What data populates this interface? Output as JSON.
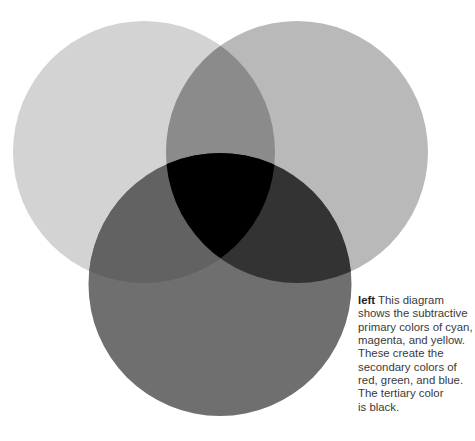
{
  "diagram": {
    "type": "venn-subtractive-color",
    "circles": [
      {
        "name": "cyan",
        "cx": 144,
        "cy": 152,
        "r": 131,
        "fill": "#d3d3d3"
      },
      {
        "name": "magenta",
        "cx": 297,
        "cy": 152,
        "r": 131,
        "fill": "#b9b9b9"
      },
      {
        "name": "yellow",
        "cx": 220,
        "cy": 284.5,
        "r": 131.5,
        "fill": "#6f6f6f"
      }
    ],
    "overlaps": {
      "cyan_magenta": "#8b8b8b",
      "cyan_yellow": "#626262",
      "magenta_yellow": "#333333",
      "all_three": "#000000"
    }
  },
  "caption": {
    "lead": "left",
    "lines": [
      "This diagram",
      "shows the subtractive",
      "primary colors of cyan,",
      "magenta, and yellow.",
      "These create the",
      "secondary colors of",
      "red, green, and blue.",
      "The tertiary color",
      "is black."
    ]
  }
}
